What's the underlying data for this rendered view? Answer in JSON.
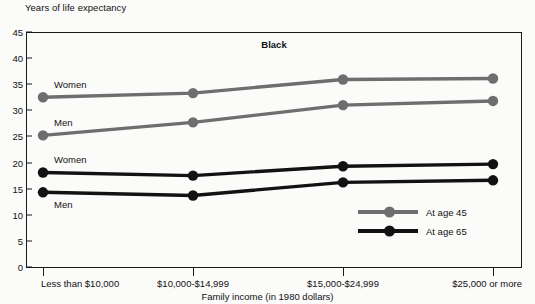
{
  "figure": {
    "ylabel_top": "Years of life expectancy",
    "title": "Black",
    "xlabel": "Family income (in 1980 dollars)"
  },
  "legend": {
    "items": [
      {
        "label": "At age 45",
        "color": "#6e6e6e"
      },
      {
        "label": "At age 65",
        "color": "#121212"
      }
    ]
  },
  "annotations": [
    {
      "text": "Women",
      "series": "At age 45"
    },
    {
      "text": "Men",
      "series": "At age 45"
    },
    {
      "text": "Women",
      "series": "At age 65"
    },
    {
      "text": "Men",
      "series": "At age 65"
    }
  ],
  "chart_data": {
    "type": "line",
    "title": "Black",
    "xlabel": "Family income (in 1980 dollars)",
    "ylabel": "Years of life expectancy",
    "categories": [
      "Less than $10,000",
      "$10,000-$14,999",
      "$15,000-$24,999",
      "$25,000 or more"
    ],
    "ylim": [
      0,
      45
    ],
    "yticks": [
      0,
      5,
      10,
      15,
      20,
      25,
      30,
      35,
      40,
      45
    ],
    "grid": false,
    "legend_position": "inside-bottom-right",
    "series": [
      {
        "name": "At age 45 - Women",
        "group": "At age 45",
        "sex": "Women",
        "color": "#6e6e6e",
        "values": [
          32.5,
          33.3,
          35.9,
          36.1
        ]
      },
      {
        "name": "At age 45 - Men",
        "group": "At age 45",
        "sex": "Men",
        "color": "#6e6e6e",
        "values": [
          25.2,
          27.7,
          31.0,
          31.8
        ]
      },
      {
        "name": "At age 65 - Women",
        "group": "At age 65",
        "sex": "Women",
        "color": "#121212",
        "values": [
          18.1,
          17.5,
          19.3,
          19.7
        ]
      },
      {
        "name": "At age 65 - Men",
        "group": "At age 65",
        "sex": "Men",
        "color": "#121212",
        "values": [
          14.3,
          13.7,
          16.2,
          16.6
        ]
      }
    ]
  }
}
